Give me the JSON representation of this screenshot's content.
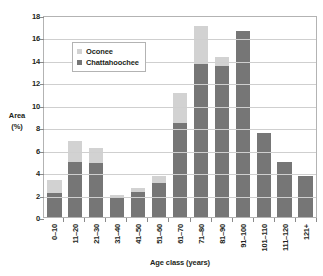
{
  "chart_data": {
    "type": "bar",
    "stacked": true,
    "title": "",
    "xlabel": "Age class (years)",
    "ylabel": "Area (%)",
    "ylabel_lines": [
      "Area",
      "(%)"
    ],
    "ylim": [
      0,
      18
    ],
    "ytick_step": 2,
    "yticks": [
      18,
      16,
      14,
      12,
      10,
      8,
      6,
      4,
      2,
      0
    ],
    "grid": true,
    "grid_axis": "y",
    "legend_position": "inside-upper-left",
    "categories": [
      "0–10",
      "11–20",
      "21–30",
      "31–40",
      "41–50",
      "51–60",
      "61–70",
      "71–80",
      "81–90",
      "91–100",
      "101–110",
      "111–120",
      "121+"
    ],
    "series": [
      {
        "name": "Chattahoochee",
        "color": "#767676",
        "values": [
          2.1,
          4.9,
          4.8,
          1.65,
          2.2,
          3.0,
          8.4,
          13.65,
          13.45,
          16.6,
          7.5,
          4.9,
          3.65
        ]
      },
      {
        "name": "Oconee",
        "color": "#d2d2d2",
        "values": [
          1.2,
          1.9,
          1.35,
          0.35,
          0.4,
          0.7,
          2.65,
          3.35,
          0.85,
          0.0,
          0.0,
          0.0,
          0.0
        ]
      }
    ],
    "totals": [
      3.3,
      6.8,
      6.15,
      2.0,
      2.6,
      3.7,
      11.05,
      17.0,
      14.3,
      16.6,
      7.5,
      4.9,
      3.65
    ]
  },
  "legend": {
    "items": [
      {
        "label": "Oconee",
        "color": "#d2d2d2"
      },
      {
        "label": "Chattahoochee",
        "color": "#767676"
      }
    ]
  },
  "axes": {
    "y_title_line1": "Area",
    "y_title_line2": "(%)",
    "x_title": "Age class (years)"
  }
}
